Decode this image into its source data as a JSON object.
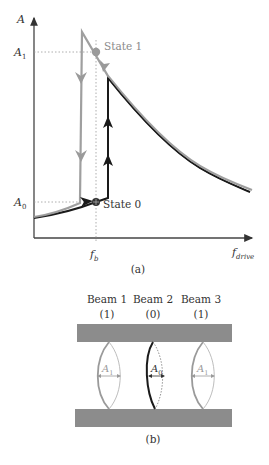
{
  "figure_a": {
    "caption": "(a)",
    "y_axis_label": "A",
    "x_axis_label_main": "f",
    "x_axis_label_sub": "drive",
    "ticks_y": [
      {
        "main": "A",
        "sub": "1"
      },
      {
        "main": "A",
        "sub": "0"
      }
    ],
    "tick_x": {
      "main": "f",
      "sub": "b"
    },
    "state1_label": "State 1",
    "state0_label": "State 0"
  },
  "figure_b": {
    "caption": "(b)",
    "beams": [
      {
        "name": "Beam 1",
        "state": "(1)",
        "amp_main": "A",
        "amp_sub": "1"
      },
      {
        "name": "Beam 2",
        "state": "(0)",
        "amp_main": "A",
        "amp_sub": "0"
      },
      {
        "name": "Beam 3",
        "state": "(1)",
        "amp_main": "A",
        "amp_sub": "1"
      }
    ]
  },
  "colors": {
    "gray_curve": "#9a9a9a",
    "black_curve": "#1a1a1a",
    "axis": "#333333",
    "label_gray": "#8a8a8a",
    "plate": "#8c8c8c"
  }
}
